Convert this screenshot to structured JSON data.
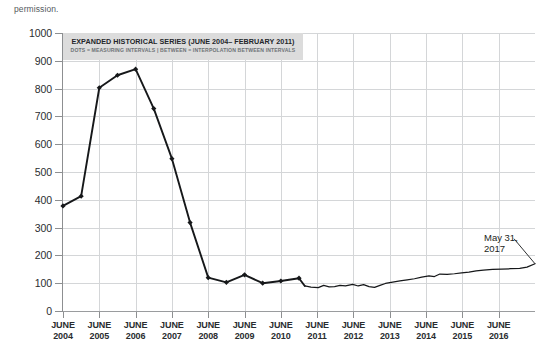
{
  "page_fragment": "permission.",
  "banner": {
    "title": "EXPANDED HISTORICAL SERIES (JUNE 2004– FEBRUARY 2011)",
    "subtitle": "DOTS = MEASURING INTERVALS | BETWEEN = INTERPOLATION BETWEEN INTERVALS"
  },
  "annotation": {
    "line1": "May 31,",
    "line2": "2017"
  },
  "chart_data": {
    "type": "line",
    "title": "EXPANDED HISTORICAL SERIES (JUNE 2004– FEBRUARY 2011)",
    "subtitle": "DOTS = MEASURING INTERVALS | BETWEEN = INTERPOLATION BETWEEN INTERVALS",
    "xlabel": "",
    "ylabel": "",
    "ylim": [
      0,
      1000
    ],
    "xlim": [
      2004.42,
      2017.42
    ],
    "grid": true,
    "legend": null,
    "ytick_labels": [
      "0",
      "100",
      "200",
      "300",
      "400",
      "500",
      "600",
      "700",
      "800",
      "900",
      "1000"
    ],
    "ytick_values": [
      0,
      100,
      200,
      300,
      400,
      500,
      600,
      700,
      800,
      900,
      1000
    ],
    "xtick_labels": [
      [
        "JUNE",
        "2004"
      ],
      [
        "JUNE",
        "2005"
      ],
      [
        "JUNE",
        "2006"
      ],
      [
        "JUNE",
        "2007"
      ],
      [
        "JUNE",
        "2008"
      ],
      [
        "JUNE",
        "2009"
      ],
      [
        "JUNE",
        "2010"
      ],
      [
        "JUNE",
        "2011"
      ],
      [
        "JUNE",
        "2012"
      ],
      [
        "JUNE",
        "2013"
      ],
      [
        "JUNE",
        "2014"
      ],
      [
        "JUNE",
        "2015"
      ],
      [
        "JUNE",
        "2016"
      ]
    ],
    "xtick_values": [
      2004.42,
      2005.42,
      2006.42,
      2007.42,
      2008.42,
      2009.42,
      2010.42,
      2011.42,
      2012.42,
      2013.42,
      2014.42,
      2015.42,
      2016.42
    ],
    "series": [
      {
        "name": "measured-intervals",
        "markers": "diamond",
        "note": "Dots = measuring intervals; segments between = interpolation",
        "points": [
          {
            "x": 2004.42,
            "y": 378
          },
          {
            "x": 2004.92,
            "y": 413
          },
          {
            "x": 2005.42,
            "y": 803
          },
          {
            "x": 2005.92,
            "y": 848
          },
          {
            "x": 2006.42,
            "y": 870
          },
          {
            "x": 2006.92,
            "y": 728
          },
          {
            "x": 2007.42,
            "y": 548
          },
          {
            "x": 2007.92,
            "y": 318
          },
          {
            "x": 2008.42,
            "y": 120
          },
          {
            "x": 2008.92,
            "y": 103
          },
          {
            "x": 2009.42,
            "y": 130
          },
          {
            "x": 2009.92,
            "y": 100
          },
          {
            "x": 2010.42,
            "y": 108
          },
          {
            "x": 2010.92,
            "y": 118
          },
          {
            "x": 2011.08,
            "y": 90
          }
        ]
      },
      {
        "name": "continuous-series",
        "markers": "none",
        "note": "High-frequency series after February 2011 through May 31, 2017",
        "points": [
          {
            "x": 2011.08,
            "y": 90
          },
          {
            "x": 2011.25,
            "y": 86
          },
          {
            "x": 2011.45,
            "y": 84
          },
          {
            "x": 2011.6,
            "y": 92
          },
          {
            "x": 2011.75,
            "y": 87
          },
          {
            "x": 2011.9,
            "y": 88
          },
          {
            "x": 2012.05,
            "y": 92
          },
          {
            "x": 2012.2,
            "y": 90
          },
          {
            "x": 2012.4,
            "y": 96
          },
          {
            "x": 2012.55,
            "y": 90
          },
          {
            "x": 2012.7,
            "y": 95
          },
          {
            "x": 2012.85,
            "y": 88
          },
          {
            "x": 2013.0,
            "y": 85
          },
          {
            "x": 2013.15,
            "y": 92
          },
          {
            "x": 2013.3,
            "y": 99
          },
          {
            "x": 2013.5,
            "y": 104
          },
          {
            "x": 2013.7,
            "y": 108
          },
          {
            "x": 2013.9,
            "y": 112
          },
          {
            "x": 2014.1,
            "y": 116
          },
          {
            "x": 2014.3,
            "y": 122
          },
          {
            "x": 2014.5,
            "y": 126
          },
          {
            "x": 2014.65,
            "y": 124
          },
          {
            "x": 2014.8,
            "y": 133
          },
          {
            "x": 2015.0,
            "y": 132
          },
          {
            "x": 2015.2,
            "y": 134
          },
          {
            "x": 2015.4,
            "y": 137
          },
          {
            "x": 2015.6,
            "y": 140
          },
          {
            "x": 2015.8,
            "y": 144
          },
          {
            "x": 2016.0,
            "y": 147
          },
          {
            "x": 2016.25,
            "y": 150
          },
          {
            "x": 2016.5,
            "y": 151
          },
          {
            "x": 2016.75,
            "y": 152
          },
          {
            "x": 2017.0,
            "y": 153
          },
          {
            "x": 2017.2,
            "y": 158
          },
          {
            "x": 2017.42,
            "y": 170
          }
        ]
      }
    ],
    "annotations": [
      {
        "text": "May 31, 2017",
        "x": 2017.42,
        "y": 170,
        "leader": true
      }
    ]
  }
}
